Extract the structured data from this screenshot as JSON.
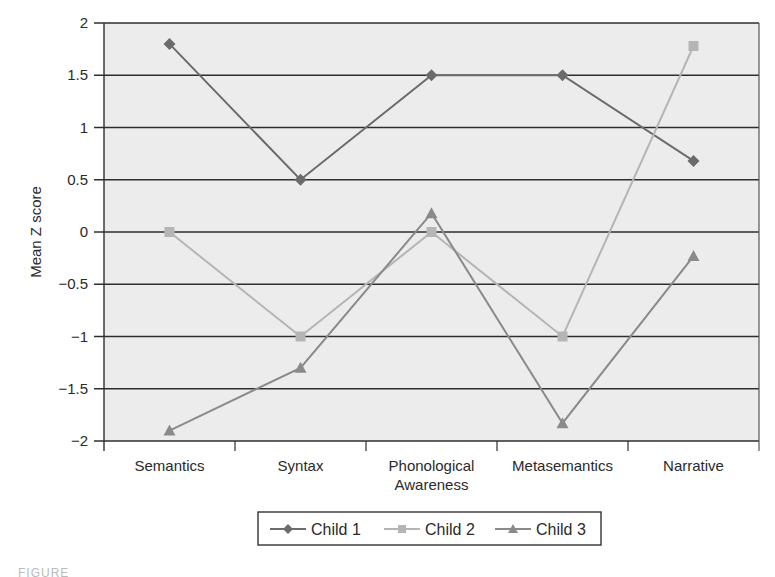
{
  "chart_data": {
    "type": "line",
    "title": "",
    "xlabel": "",
    "ylabel": "Mean Z score",
    "categories": [
      "Semantics",
      "Syntax",
      "Phonological Awareness",
      "Metasemantics",
      "Narrative"
    ],
    "category_lines": [
      [
        "Semantics"
      ],
      [
        "Syntax"
      ],
      [
        "Phonological",
        "Awareness"
      ],
      [
        "Metasemantics"
      ],
      [
        "Narrative"
      ]
    ],
    "ylim": [
      -2,
      2
    ],
    "yticks": [
      2,
      1.5,
      1,
      0.5,
      0,
      -0.5,
      -1,
      -1.5,
      -2
    ],
    "ytick_labels": [
      "2",
      "1.5",
      "1",
      "0.5",
      "0",
      "−0.5",
      "−1",
      "−1.5",
      "−2"
    ],
    "grid": true,
    "legend_position": "bottom",
    "series": [
      {
        "name": "Child 1",
        "marker": "diamond",
        "color": "#6b6b6b",
        "values": [
          1.8,
          0.5,
          1.5,
          1.5,
          0.68
        ]
      },
      {
        "name": "Child 2",
        "marker": "square",
        "color": "#b5b5b5",
        "values": [
          0,
          -1,
          0,
          -1,
          1.78
        ]
      },
      {
        "name": "Child 3",
        "marker": "triangle",
        "color": "#8a8a8a",
        "values": [
          -1.9,
          -1.3,
          0.18,
          -1.83,
          -0.23
        ]
      }
    ]
  },
  "caption": "FIGURE"
}
